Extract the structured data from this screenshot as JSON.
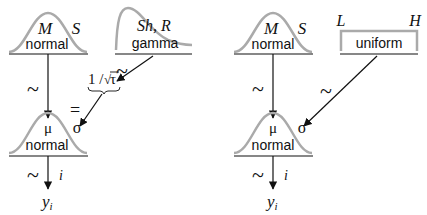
{
  "left_diagram": {
    "prior_mu": {
      "params": [
        "M",
        "S"
      ],
      "dist_label": "normal",
      "relation": "~"
    },
    "prior_tau": {
      "params": "Sh, R",
      "dist_label": "gamma",
      "relation": "~"
    },
    "transform": {
      "expr_prefix": "1 / ",
      "expr_sqrt": "√",
      "expr_var": "τ",
      "relation": "="
    },
    "likelihood": {
      "params": [
        "μ",
        "σ"
      ],
      "dist_label": "normal",
      "relation": "~",
      "index": "i"
    },
    "data": {
      "var": "y",
      "subscript": "i"
    }
  },
  "right_diagram": {
    "prior_mu": {
      "params": [
        "M",
        "S"
      ],
      "dist_label": "normal",
      "relation": "~"
    },
    "prior_sigma": {
      "params": [
        "L",
        "H"
      ],
      "dist_label": "uniform",
      "relation": "~"
    },
    "likelihood": {
      "params": [
        "μ",
        "σ"
      ],
      "dist_label": "normal",
      "relation": "~",
      "index": "i"
    },
    "data": {
      "var": "y",
      "subscript": "i"
    }
  },
  "colors": {
    "curve": "#aaaaaa",
    "ink": "#111111"
  }
}
